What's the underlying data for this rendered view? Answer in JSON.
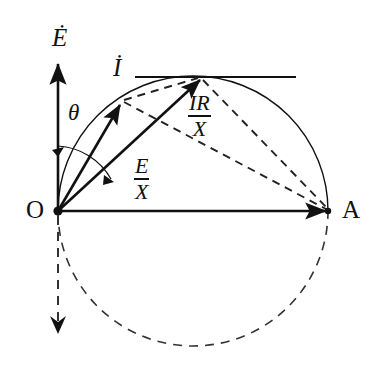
{
  "figure": {
    "kind": "phasor-diagram",
    "background_color": "#ffffff",
    "stroke_color": "#111111"
  },
  "axes": {
    "vertical_axis_label": "Ė",
    "origin_label": "O",
    "right_point_label": "A"
  },
  "angle": {
    "symbol": "θ"
  },
  "vectors": [
    {
      "name": "current-phasor",
      "label": "İ",
      "style": "solid",
      "from": "O",
      "to": "circle-point"
    },
    {
      "name": "e-over-x-phasor",
      "label_numerator": "E",
      "label_denominator": "X",
      "style": "solid",
      "from": "O",
      "to": "circle-top"
    }
  ],
  "labels": {
    "e_over_x": {
      "numerator": "E",
      "denominator": "X"
    },
    "ir_over_x": {
      "numerator": "IR",
      "denominator": "X"
    }
  },
  "geometry": {
    "origin": {
      "x": 58,
      "y": 211
    },
    "point_a": {
      "x": 328,
      "y": 211
    },
    "circle_center": {
      "x": 193,
      "y": 211
    },
    "circle_radius": 135,
    "i_tip": {
      "x": 122,
      "y": 102
    },
    "ex_tip": {
      "x": 202,
      "y": 77
    },
    "tangent_line_y": 77,
    "tangent_line_x1": 135,
    "tangent_line_x2": 296,
    "vertical_axis_top_y": 62,
    "down_arrow_tip_y": 330
  }
}
